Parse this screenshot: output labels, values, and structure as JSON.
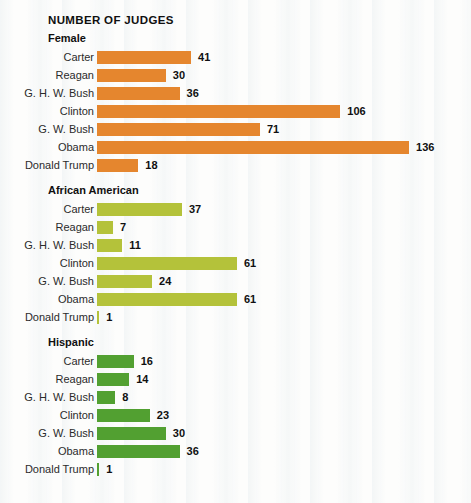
{
  "chart_data": {
    "type": "bar",
    "title": "NUMBER OF JUDGES",
    "xlabel": "",
    "ylabel": "",
    "orientation": "horizontal",
    "grid": false,
    "legend": "none",
    "value_labels": true,
    "categories": [
      "Carter",
      "Reagan",
      "G. H. W. Bush",
      "Clinton",
      "G. W. Bush",
      "Obama",
      "Donald Trump"
    ],
    "xlim": [
      0,
      136
    ],
    "panels": [
      {
        "name": "Female",
        "color": "#E5862E",
        "values": [
          41,
          30,
          36,
          106,
          71,
          136,
          18
        ],
        "bars": [
          {
            "label": "Carter",
            "value": 41,
            "value_text": "41"
          },
          {
            "label": "Reagan",
            "value": 30,
            "value_text": "30"
          },
          {
            "label": "G. H. W. Bush",
            "value": 36,
            "value_text": "36"
          },
          {
            "label": "Clinton",
            "value": 106,
            "value_text": "106"
          },
          {
            "label": "G. W. Bush",
            "value": 71,
            "value_text": "71"
          },
          {
            "label": "Obama",
            "value": 136,
            "value_text": "136"
          },
          {
            "label": "Donald Trump",
            "value": 18,
            "value_text": "18"
          }
        ]
      },
      {
        "name": "African American",
        "color": "#B4C23A",
        "values": [
          37,
          7,
          11,
          61,
          24,
          61,
          1
        ],
        "bars": [
          {
            "label": "Carter",
            "value": 37,
            "value_text": "37"
          },
          {
            "label": "Reagan",
            "value": 7,
            "value_text": "7"
          },
          {
            "label": "G. H. W. Bush",
            "value": 11,
            "value_text": "11"
          },
          {
            "label": "Clinton",
            "value": 61,
            "value_text": "61"
          },
          {
            "label": "G. W. Bush",
            "value": 24,
            "value_text": "24"
          },
          {
            "label": "Obama",
            "value": 61,
            "value_text": "61"
          },
          {
            "label": "Donald Trump",
            "value": 1,
            "value_text": "1"
          }
        ]
      },
      {
        "name": "Hispanic",
        "color": "#52A031",
        "values": [
          16,
          14,
          8,
          23,
          30,
          36,
          1
        ],
        "bars": [
          {
            "label": "Carter",
            "value": 16,
            "value_text": "16"
          },
          {
            "label": "Reagan",
            "value": 14,
            "value_text": "14"
          },
          {
            "label": "G. H. W. Bush",
            "value": 8,
            "value_text": "8"
          },
          {
            "label": "Clinton",
            "value": 23,
            "value_text": "23"
          },
          {
            "label": "G. W. Bush",
            "value": 30,
            "value_text": "30"
          },
          {
            "label": "Obama",
            "value": 36,
            "value_text": "36"
          },
          {
            "label": "Donald Trump",
            "value": 1,
            "value_text": "1"
          }
        ]
      }
    ]
  },
  "layout": {
    "px_per_unit": 2.295
  }
}
